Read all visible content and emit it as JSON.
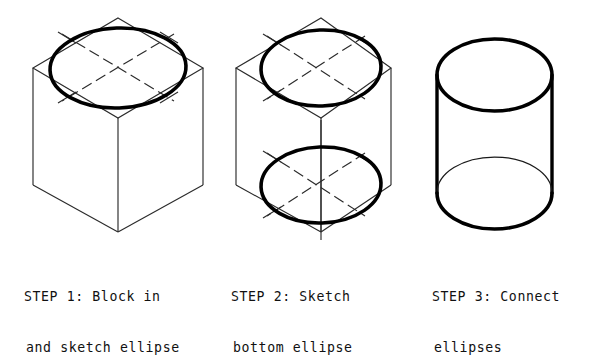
{
  "figure": {
    "background_color": "#ffffff",
    "line_color": "#2b2b2b",
    "bold_line_color": "#000000",
    "steps": [
      {
        "id": "step-1",
        "number": "1",
        "caption_line_1": "STEP 1: Block in",
        "caption_line_2": "and sketch ellipse",
        "description": "Isometric cube blocked in with one bold ellipse inscribed in the top rhombus face",
        "ellipse_count": 1,
        "shapes": [
          "isometric-cube",
          "top-ellipse",
          "center-lines",
          "tangent-ticks"
        ]
      },
      {
        "id": "step-2",
        "number": "2",
        "caption_line_1": "STEP 2: Sketch",
        "caption_line_2": "bottom ellipse",
        "description": "Same isometric cube with bold ellipses inscribed in both the top and bottom rhombus faces",
        "ellipse_count": 2,
        "shapes": [
          "isometric-cube",
          "top-ellipse",
          "bottom-ellipse",
          "center-lines",
          "tangent-ticks",
          "vertical-axis"
        ]
      },
      {
        "id": "step-3",
        "number": "3",
        "caption_line_1": "STEP 3: Connect",
        "caption_line_2": "ellipses",
        "description": "Finished cylinder: top ellipse, two vertical side elements and bottom ellipse with hidden back arc",
        "ellipse_count": 2,
        "shapes": [
          "top-ellipse",
          "left-side-line",
          "right-side-line",
          "bottom-ellipse",
          "hidden-back-arc"
        ]
      }
    ]
  }
}
